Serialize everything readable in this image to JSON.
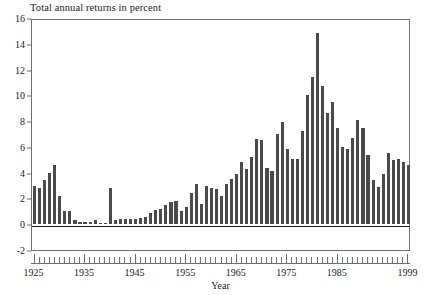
{
  "chart_data": {
    "type": "bar",
    "title": "Total annual returns in percent",
    "xlabel": "Year",
    "ylabel": "",
    "xlim": [
      1924.5,
      1999.5
    ],
    "ylim": [
      -2,
      16
    ],
    "yticks": [
      -2,
      0,
      2,
      4,
      6,
      8,
      10,
      12,
      14,
      16
    ],
    "ytick_labels": [
      "-2",
      "0",
      "2",
      "4",
      "6",
      "8",
      "10",
      "12",
      "14",
      "16"
    ],
    "xtick_labels": [
      "1925",
      "1935",
      "1945",
      "1955",
      "1965",
      "1975",
      "1985",
      "1999"
    ],
    "xtick_values": [
      1925,
      1935,
      1945,
      1955,
      1965,
      1975,
      1985,
      1999
    ],
    "grid": false,
    "legend": null,
    "bar_color": "#4a4a4a",
    "axis_color": "#6e6e6e",
    "categories": [
      1925,
      1926,
      1927,
      1928,
      1929,
      1930,
      1931,
      1932,
      1933,
      1934,
      1935,
      1936,
      1937,
      1938,
      1939,
      1940,
      1941,
      1942,
      1943,
      1944,
      1945,
      1946,
      1947,
      1948,
      1949,
      1950,
      1951,
      1952,
      1953,
      1954,
      1955,
      1956,
      1957,
      1958,
      1959,
      1960,
      1961,
      1962,
      1963,
      1964,
      1965,
      1966,
      1967,
      1968,
      1969,
      1970,
      1971,
      1972,
      1973,
      1974,
      1975,
      1976,
      1977,
      1978,
      1979,
      1980,
      1981,
      1982,
      1983,
      1984,
      1985,
      1986,
      1987,
      1988,
      1989,
      1990,
      1991,
      1992,
      1993,
      1994,
      1995,
      1996,
      1997,
      1998,
      1999
    ],
    "values": [
      3.0,
      2.8,
      3.4,
      4.0,
      4.6,
      2.2,
      1.0,
      1.0,
      0.3,
      0.2,
      0.2,
      0.2,
      0.3,
      0.1,
      0.1,
      2.8,
      0.3,
      0.4,
      0.4,
      0.4,
      0.4,
      0.5,
      0.6,
      0.9,
      1.1,
      1.2,
      1.5,
      1.7,
      1.8,
      1.0,
      1.3,
      2.4,
      3.1,
      1.6,
      3.0,
      2.8,
      2.7,
      2.2,
      3.1,
      3.5,
      3.9,
      4.8,
      4.3,
      5.2,
      6.6,
      6.5,
      4.4,
      4.1,
      7.0,
      7.9,
      5.8,
      5.1,
      5.1,
      7.2,
      10.0,
      11.4,
      14.8,
      10.7,
      8.6,
      9.5,
      7.5,
      6.0,
      5.8,
      6.7,
      8.1,
      7.5,
      5.4,
      3.4,
      2.9,
      3.9,
      5.5,
      5.0,
      5.1,
      4.8,
      4.6
    ]
  }
}
